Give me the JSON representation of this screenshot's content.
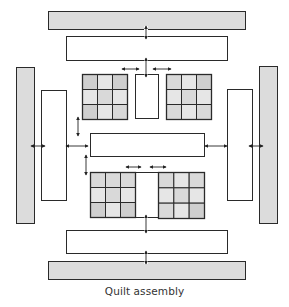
{
  "caption": "Quilt assembly",
  "colors": {
    "stroke": "#2a2a2a",
    "border_fill": "#dcdcdc",
    "sashing_fill": "#ffffff",
    "patch_dark": "#cfcfcf",
    "patch_mid": "#d9d9d9",
    "patch_light": "#e6e6e6",
    "arrow": "#222222"
  },
  "outer_borders": [
    {
      "id": "top-border",
      "x": 48,
      "y": 11,
      "w": 197,
      "h": 18
    },
    {
      "id": "bottom-border",
      "x": 48,
      "y": 261,
      "w": 197,
      "h": 18
    },
    {
      "id": "left-border",
      "x": 16,
      "y": 67,
      "w": 18,
      "h": 156
    },
    {
      "id": "right-border",
      "x": 259,
      "y": 66,
      "w": 18,
      "h": 157
    }
  ],
  "inner_sashing": [
    {
      "id": "top-sashing",
      "x": 66,
      "y": 36,
      "w": 161,
      "h": 24
    },
    {
      "id": "bottom-sashing",
      "x": 66,
      "y": 230,
      "w": 161,
      "h": 23
    },
    {
      "id": "left-sashing",
      "x": 41,
      "y": 90,
      "w": 25,
      "h": 110
    },
    {
      "id": "right-sashing",
      "x": 227,
      "y": 89,
      "w": 25,
      "h": 111
    },
    {
      "id": "middle-sashing",
      "x": 90,
      "y": 133,
      "w": 114,
      "h": 23
    },
    {
      "id": "top-center-strip",
      "x": 135,
      "y": 74,
      "w": 23,
      "h": 44
    },
    {
      "id": "bottom-center-strip",
      "x": 135,
      "y": 172,
      "w": 23,
      "h": 45
    }
  ],
  "nine_patch_blocks": [
    {
      "id": "block-top-left",
      "x": 82,
      "y": 74,
      "size": 45,
      "shades": [
        "dark",
        "light",
        "dark",
        "light",
        "mid",
        "light",
        "dark",
        "light",
        "mid"
      ]
    },
    {
      "id": "block-top-right",
      "x": 166,
      "y": 74,
      "size": 45,
      "shades": [
        "mid",
        "light",
        "dark",
        "light",
        "mid",
        "light",
        "mid",
        "light",
        "mid"
      ]
    },
    {
      "id": "block-bottom-left",
      "x": 90,
      "y": 172,
      "size": 45,
      "shades": [
        "mid",
        "mid",
        "mid",
        "light",
        "mid",
        "light",
        "dark",
        "light",
        "dark"
      ]
    },
    {
      "id": "block-bottom-right",
      "x": 158,
      "y": 172,
      "size": 46,
      "shades": [
        "mid",
        "light",
        "mid",
        "light",
        "mid",
        "light",
        "mid",
        "light",
        "dark"
      ]
    }
  ],
  "arrows": [
    {
      "id": "arrow-top-border",
      "dir": "v",
      "x": 146,
      "y1": 26,
      "y2": 39
    },
    {
      "id": "arrow-top-sashing",
      "dir": "v",
      "x": 146,
      "y1": 58,
      "y2": 77
    },
    {
      "id": "arrow-top-left-h",
      "dir": "h",
      "y": 69,
      "x1": 122,
      "x2": 139
    },
    {
      "id": "arrow-top-right-h",
      "dir": "h",
      "y": 69,
      "x1": 153,
      "x2": 171
    },
    {
      "id": "arrow-left-vert",
      "dir": "v",
      "x": 78,
      "y1": 117,
      "y2": 136
    },
    {
      "id": "arrow-left-lower-vert",
      "dir": "v",
      "x": 86,
      "y1": 155,
      "y2": 175
    },
    {
      "id": "arrow-left-border-h",
      "dir": "h",
      "y": 146,
      "x1": 31,
      "x2": 45
    },
    {
      "id": "arrow-left-sashing-h",
      "dir": "h",
      "y": 146,
      "x1": 66,
      "x2": 88
    },
    {
      "id": "arrow-right-sashing-h",
      "dir": "h",
      "y": 146,
      "x1": 205,
      "x2": 227
    },
    {
      "id": "arrow-right-border-h",
      "dir": "h",
      "y": 146,
      "x1": 249,
      "x2": 263
    },
    {
      "id": "arrow-bottom-left-h",
      "dir": "h",
      "y": 167,
      "x1": 126,
      "x2": 141
    },
    {
      "id": "arrow-bottom-right-h",
      "dir": "h",
      "y": 167,
      "x1": 150,
      "x2": 166
    },
    {
      "id": "arrow-bottom-sashing",
      "dir": "v",
      "x": 146,
      "y1": 215,
      "y2": 233
    },
    {
      "id": "arrow-bottom-border",
      "dir": "v",
      "x": 146,
      "y1": 251,
      "y2": 264
    }
  ]
}
